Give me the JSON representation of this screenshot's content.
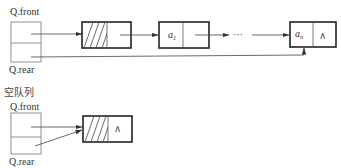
{
  "diagram": {
    "type": "linked-queue",
    "colors": {
      "stroke": "#333333",
      "thin": "#666666",
      "background": "#ffffff"
    },
    "nonempty": {
      "front_label": "Q.front",
      "rear_label": "Q.rear",
      "head_node": {
        "data": "hatched",
        "next": "→ a1"
      },
      "nodes": [
        {
          "data": "a",
          "sub": "1"
        },
        {
          "data": "a",
          "sub": "n",
          "next": "∧"
        }
      ],
      "ellipsis": "···"
    },
    "empty": {
      "caption": "空队列",
      "front_label": "Q.front",
      "rear_label": "Q.rear",
      "head_node": {
        "data": "hatched",
        "next": "∧"
      }
    }
  }
}
